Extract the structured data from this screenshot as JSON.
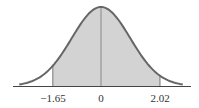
{
  "figure": {
    "type": "normal-distribution-shaded-region",
    "curve_color": "#666666",
    "fill_color": "#d3d3d3",
    "axis_color": "#444444",
    "labels": {
      "left": "−1.65",
      "center": "0",
      "right": "2.02"
    },
    "shaded_from": -1.65,
    "shaded_to": 2.02,
    "mean": 0
  }
}
